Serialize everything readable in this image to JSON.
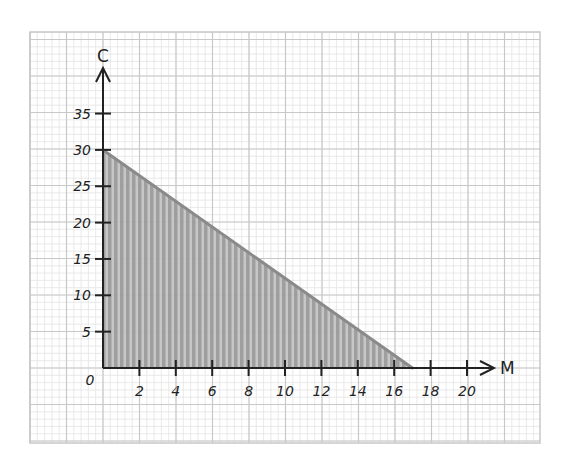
{
  "chart_data": {
    "type": "area",
    "title": "",
    "xlabel": "M",
    "ylabel": "C",
    "xlim": [
      0,
      21
    ],
    "ylim": [
      0,
      37
    ],
    "grid": true,
    "legend": null,
    "x_ticks": [
      2,
      4,
      6,
      8,
      10,
      12,
      14,
      16,
      18,
      20
    ],
    "x_tick_labels": [
      "2",
      "4",
      "6",
      "8",
      "10",
      "12",
      "14",
      "16",
      "18",
      "20"
    ],
    "y_ticks": [
      5,
      10,
      15,
      20,
      25,
      30,
      35
    ],
    "y_tick_labels": [
      "5",
      "10",
      "15",
      "20",
      "25",
      "30",
      "35"
    ],
    "origin_label": "0",
    "series": [
      {
        "name": "feasible region",
        "type": "shaded polygon",
        "points": [
          [
            0,
            0
          ],
          [
            0,
            30
          ],
          [
            17,
            0
          ]
        ],
        "boundary_line": {
          "from": [
            0,
            30
          ],
          "to": [
            17,
            0
          ]
        }
      }
    ]
  },
  "colors": {
    "grid_minor": "#e4e4e4",
    "grid_major": "#c8c8c8",
    "axis": "#222222",
    "shade": "#9a9a9a",
    "boundary": "#8a8a8a"
  }
}
